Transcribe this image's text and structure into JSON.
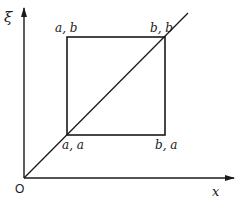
{
  "diagram": {
    "axes": {
      "y_label": "ξ",
      "x_label": "x",
      "origin_label": "O"
    },
    "corners": {
      "top_left": "a, b",
      "top_right": "b, b",
      "bottom_left": "a, a",
      "bottom_right": "b, a"
    },
    "elements": [
      "y-axis arrow",
      "x-axis arrow",
      "square a≤x≤b, a≤ξ≤b",
      "diagonal line ξ = x"
    ],
    "colors": {
      "line": "#1a1a1a",
      "background": "#ffffff"
    }
  }
}
